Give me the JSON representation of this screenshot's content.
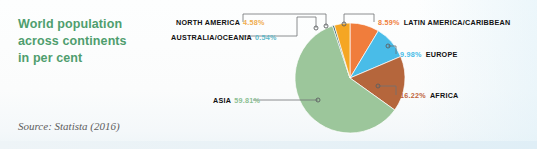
{
  "card": {
    "title_lines": [
      "World population",
      "across continents",
      "in per cent"
    ],
    "source": "Source: Statista (2016)",
    "title_color": "#4f9e6e",
    "background_color": "#fcfdfd"
  },
  "chart_data": {
    "type": "pie",
    "title": "World population across continents in per cent",
    "unit": "percent",
    "categories": [
      "ASIA",
      "AFRICA",
      "EUROPE",
      "LATIN AMERICA/CARIBBEAN",
      "NORTH AMERICA",
      "AUSTRALIA/OCEANIA"
    ],
    "values": [
      59.81,
      16.22,
      9.98,
      8.59,
      4.58,
      0.54
    ],
    "value_labels": [
      "59.81%",
      "16.22%",
      "9.98%",
      "8.59%",
      "4.58%",
      "0.54%"
    ],
    "colors": [
      "#9cc69b",
      "#b5663c",
      "#49bce8",
      "#f07d3c",
      "#f5a623",
      "#2c5f63"
    ],
    "legend": "callout-labels",
    "grid": false,
    "slices": [
      {
        "label": "LATIN AMERICA/CARIBBEAN",
        "value": 8.59,
        "value_label": "8.59%",
        "color": "#f07d3c"
      },
      {
        "label": "EUROPE",
        "value": 9.98,
        "value_label": "9.98%",
        "color": "#49bce8"
      },
      {
        "label": "AFRICA",
        "value": 16.22,
        "value_label": "16.22%",
        "color": "#b5663c"
      },
      {
        "label": "ASIA",
        "value": 59.81,
        "value_label": "59.81%",
        "color": "#9cc69b"
      },
      {
        "label": "AUSTRALIA/OCEANIA",
        "value": 0.54,
        "value_label": "0.54%",
        "color": "#2c5f63"
      },
      {
        "label": "NORTH AMERICA",
        "value": 4.58,
        "value_label": "4.58%",
        "color": "#f5a623"
      }
    ]
  },
  "labels": {
    "north_america": {
      "name": "NORTH AMERICA",
      "pct": "4.58%",
      "color": "#f0ad4e"
    },
    "australia_oceania": {
      "name": "AUSTRALIA/OCEANIA",
      "pct": "0.54%",
      "color": "#5fb8c9"
    },
    "latin_america": {
      "name": "LATIN AMERICA/CARIBBEAN",
      "pct": "8.59%",
      "color": "#f07d3c"
    },
    "europe": {
      "name": "EUROPE",
      "pct": "9.98%",
      "color": "#49bce8"
    },
    "africa": {
      "name": "AFRICA",
      "pct": "16.22%",
      "color": "#c0643a"
    },
    "asia": {
      "name": "ASIA",
      "pct": "59.81%",
      "color": "#8cbf92"
    }
  }
}
